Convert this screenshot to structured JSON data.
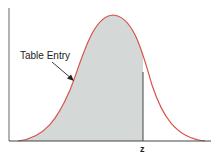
{
  "diagram": {
    "annotation_label": "Table Entry",
    "z_label": "z",
    "colors": {
      "curve": "#d9534a",
      "shade": "#d4d8d7",
      "axis": "#444444",
      "text": "#222222"
    }
  }
}
